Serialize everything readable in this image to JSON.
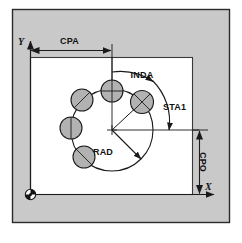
{
  "figure": {
    "panel_bg": "#c9c9c9",
    "panel_border": "#2b2b2b",
    "workpiece_bg": "#ffffff",
    "hole_fill": "#b2b2b2",
    "line_color": "#1a1a1a"
  },
  "axes": {
    "x_label": "X",
    "y_label": "Y",
    "origin_name": "workpiece-zero"
  },
  "dimensions": {
    "cpa": {
      "label": "CPA",
      "desc": "center point abscissa"
    },
    "cpo": {
      "label": "CPO",
      "desc": "center point ordinate"
    },
    "rad": {
      "label": "RAD",
      "desc": "bolt circle radius"
    },
    "sta1": {
      "label": "STA1",
      "desc": "starting angle"
    },
    "inda": {
      "label": "INDA",
      "desc": "indexing angle"
    }
  },
  "pattern": {
    "hole_count": 5,
    "holes": [
      {
        "name": "hole-1",
        "cx": 142,
        "cy": 102,
        "r": 11.5,
        "mark": "cross-x"
      },
      {
        "name": "hole-2",
        "cx": 112,
        "cy": 91,
        "r": 11.0,
        "mark": "cross-plus"
      },
      {
        "name": "hole-3",
        "cx": 82,
        "cy": 100,
        "r": 11.0,
        "mark": "cross-tilt"
      },
      {
        "name": "hole-4",
        "cx": 71,
        "cy": 128,
        "r": 11.0,
        "mark": "cross-tilt2"
      },
      {
        "name": "hole-5",
        "cx": 84,
        "cy": 157,
        "r": 11.0,
        "mark": "cross-tilt"
      }
    ],
    "center": {
      "cx": 112,
      "cy": 130
    },
    "circle_radius": 41
  }
}
